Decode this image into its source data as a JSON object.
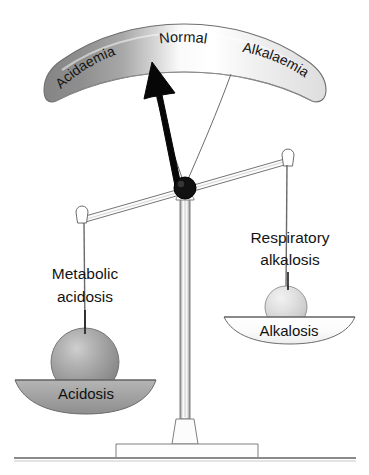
{
  "figure": {
    "type": "balance-scale-diagram",
    "background_color": "#ffffff",
    "ink_color": "#1a1a1a"
  },
  "gauge": {
    "name": "acid-base-arc",
    "zones": [
      {
        "id": "acidaemia",
        "label": "Acidaemia",
        "fill": "#8f8f8f"
      },
      {
        "id": "normal",
        "label": "Normal",
        "fill": "#fdfdfd"
      },
      {
        "id": "alkalaemia",
        "label": "Alkalaemia",
        "fill": "#e4e4e4"
      }
    ],
    "outline_color": "#7a7a7a"
  },
  "needle": {
    "name": "indicator-needle",
    "color": "#000000",
    "points_to": "Acidaemia"
  },
  "beam": {
    "name": "balance-beam",
    "color": "#6e6e6e",
    "tilt": "left-side-down"
  },
  "pivot": {
    "name": "pivot-hub",
    "color": "#111111"
  },
  "column": {
    "name": "support-column",
    "color": "#8a8a8a"
  },
  "base": {
    "name": "stand-base",
    "color": "#8a8a8a"
  },
  "left_pan": {
    "name": "acidosis-pan",
    "pan_label": "Acidosis",
    "pan_fill": "#a3a3a3",
    "weight_label_line1": "Metabolic",
    "weight_label_line2": "acidosis",
    "weight_fill": "#9a9a9a"
  },
  "right_pan": {
    "name": "alkalosis-pan",
    "pan_label": "Alkalosis",
    "pan_fill": "#fbfbfb",
    "weight_label_line1": "Respiratory",
    "weight_label_line2": "alkalosis",
    "weight_fill": "#d6d6d6"
  }
}
